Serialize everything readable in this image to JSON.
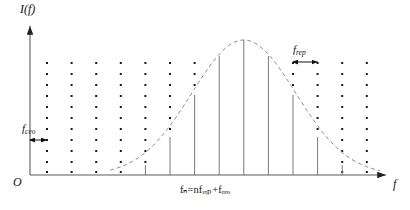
{
  "figure": {
    "kind": "frequency-comb-spectrum",
    "axes": {
      "y_label": "I(f)",
      "x_label": "f",
      "origin_label": "O"
    },
    "annotations": {
      "ceo_label_base": "f",
      "ceo_label_sub": "ceo",
      "rep_label_base": "f",
      "rep_label_sub": "rep",
      "formula": "fₙ=nfᵣₑₚ+fₑₑₒ"
    },
    "colors": {
      "ink": "#111111",
      "axis": "#4a4a4a",
      "comb_dot": "#1a1a1a",
      "comb_line": "#7a7a7a",
      "envelope": "#8a8a8a",
      "background": "#ffffff"
    }
  },
  "chart_data": {
    "type": "line",
    "title": "",
    "xlabel": "f",
    "ylabel": "I(f)",
    "grid": false,
    "legend": null,
    "axis_origin_px": {
      "x": 30,
      "y": 175
    },
    "axis_top_px": 22,
    "axis_right_px": 390,
    "comb": {
      "description": "Equally spaced comb teeth; dotted markers span full plot height, solid stems drawn up to the Gaussian envelope.",
      "tooth_spacing_px": 24.6,
      "first_tooth_x_px": 47,
      "tooth_count": 14,
      "x_positions_px": [
        47,
        71.6,
        96.2,
        120.8,
        145.4,
        170,
        194.6,
        219.2,
        243.8,
        268.4,
        293,
        317.6,
        342.2,
        366.8
      ],
      "dot_rows_y_px": [
        63,
        74,
        85,
        96,
        107,
        118,
        129,
        140,
        151,
        162,
        172
      ],
      "envelope_heights_px": [
        0,
        0,
        0,
        1,
        10,
        38,
        80,
        119,
        135,
        119,
        80,
        38,
        10,
        1
      ],
      "solid_stem_indices": [
        4,
        5,
        6,
        7,
        8,
        9,
        10,
        11
      ]
    },
    "envelope": {
      "shape": "gaussian",
      "style": "dashed",
      "peak_x_px": 243.8,
      "peak_y_px": 40,
      "baseline_y_px": 175,
      "sigma_px": 52
    },
    "measure_ceo": {
      "label": "f_ceo",
      "from_x_px": 30,
      "to_x_px": 47,
      "y_px": 140,
      "arrow": "double-headed"
    },
    "measure_rep": {
      "label": "f_rep",
      "from_x_px": 293,
      "to_x_px": 317.6,
      "y_px": 62,
      "arrow": "double-headed"
    }
  }
}
